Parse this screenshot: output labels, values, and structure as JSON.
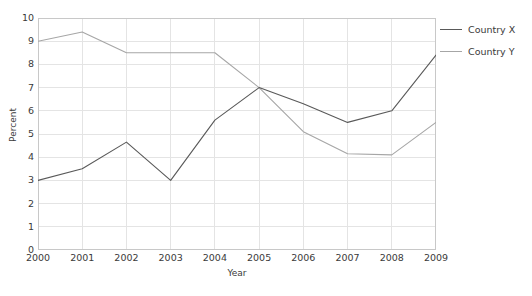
{
  "chart_data": {
    "type": "line",
    "title": "",
    "xlabel": "Year",
    "ylabel": "Percent",
    "x": [
      2000,
      2001,
      2002,
      2003,
      2004,
      2005,
      2006,
      2007,
      2008,
      2009
    ],
    "categories": [
      "2000",
      "2001",
      "2002",
      "2003",
      "2004",
      "2005",
      "2006",
      "2007",
      "2008",
      "2009"
    ],
    "series": [
      {
        "name": "Country X",
        "color": "#595959",
        "values": [
          3.0,
          3.5,
          4.65,
          3.0,
          5.6,
          7.0,
          6.3,
          5.5,
          6.0,
          8.4
        ]
      },
      {
        "name": "Country Y",
        "color": "#a6a6a6",
        "values": [
          9.0,
          9.4,
          8.5,
          8.5,
          8.5,
          7.0,
          5.1,
          4.15,
          4.1,
          5.5
        ]
      }
    ],
    "ylim": [
      0,
      10
    ],
    "yticks": [
      0,
      1,
      2,
      3,
      4,
      5,
      6,
      7,
      8,
      9,
      10
    ],
    "ytick_labels": [
      "0",
      "1",
      "2",
      "3",
      "4",
      "5",
      "6",
      "7",
      "8",
      "9",
      "10"
    ],
    "xlim": [
      2000,
      2009
    ],
    "grid": true,
    "grid_color": "#e4e4e4",
    "plot_border_color": "#c8c8c8",
    "background": "#ffffff",
    "legend_position": "right",
    "legend": [
      "Country X",
      "Country Y"
    ]
  }
}
